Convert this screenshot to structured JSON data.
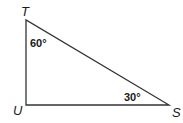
{
  "diagram": {
    "type": "right-triangle",
    "vertices": {
      "T": {
        "label": "T",
        "x": 26,
        "y": 20
      },
      "U": {
        "label": "U",
        "x": 26,
        "y": 105
      },
      "S": {
        "label": "S",
        "x": 169,
        "y": 105
      }
    },
    "angles": {
      "T": {
        "label": "60°"
      },
      "S": {
        "label": "30°"
      }
    },
    "stroke_color": "#333333"
  }
}
